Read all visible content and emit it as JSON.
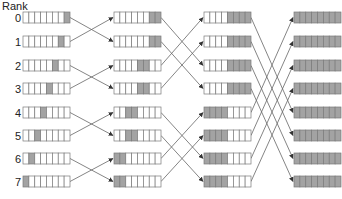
{
  "diagram": {
    "axis_label": "Rank",
    "ranks": [
      "0",
      "1",
      "2",
      "3",
      "4",
      "5",
      "6",
      "7"
    ],
    "cells_per_buffer": 8,
    "colors": {
      "filled": "#a3a3a3",
      "empty": "#ffffff",
      "border": "#7a7a7a",
      "line": "#666666"
    },
    "columns": [
      {
        "name": "step-0",
        "x": 23,
        "filled": [
          [
            7
          ],
          [
            6
          ],
          [
            5
          ],
          [
            4
          ],
          [
            3
          ],
          [
            2
          ],
          [
            1
          ],
          [
            0
          ]
        ]
      },
      {
        "name": "step-1",
        "x": 114,
        "filled": [
          [
            6,
            7
          ],
          [
            6,
            7
          ],
          [
            4,
            5
          ],
          [
            4,
            5
          ],
          [
            2,
            3
          ],
          [
            2,
            3
          ],
          [
            0,
            1
          ],
          [
            0,
            1
          ]
        ]
      },
      {
        "name": "step-2",
        "x": 204,
        "filled": [
          [
            4,
            5,
            6,
            7
          ],
          [
            4,
            5,
            6,
            7
          ],
          [
            4,
            5,
            6,
            7
          ],
          [
            4,
            5,
            6,
            7
          ],
          [
            0,
            1,
            2,
            3
          ],
          [
            0,
            1,
            2,
            3
          ],
          [
            0,
            1,
            2,
            3
          ],
          [
            0,
            1,
            2,
            3
          ]
        ]
      },
      {
        "name": "step-3",
        "x": 294,
        "filled": [
          [
            0,
            1,
            2,
            3,
            4,
            5,
            6,
            7
          ],
          [
            0,
            1,
            2,
            3,
            4,
            5,
            6,
            7
          ],
          [
            0,
            1,
            2,
            3,
            4,
            5,
            6,
            7
          ],
          [
            0,
            1,
            2,
            3,
            4,
            5,
            6,
            7
          ],
          [
            0,
            1,
            2,
            3,
            4,
            5,
            6,
            7
          ],
          [
            0,
            1,
            2,
            3,
            4,
            5,
            6,
            7
          ],
          [
            0,
            1,
            2,
            3,
            4,
            5,
            6,
            7
          ],
          [
            0,
            1,
            2,
            3,
            4,
            5,
            6,
            7
          ]
        ]
      }
    ],
    "exchanges": [
      {
        "from_column": 0,
        "to_column": 1,
        "partner_distance": 1
      },
      {
        "from_column": 1,
        "to_column": 2,
        "partner_distance": 2
      },
      {
        "from_column": 2,
        "to_column": 3,
        "partner_distance": 4
      }
    ],
    "row_tops": [
      12,
      36,
      60,
      83,
      107,
      130,
      153,
      176
    ],
    "buffer_width": 47,
    "buffer_height": 11
  }
}
